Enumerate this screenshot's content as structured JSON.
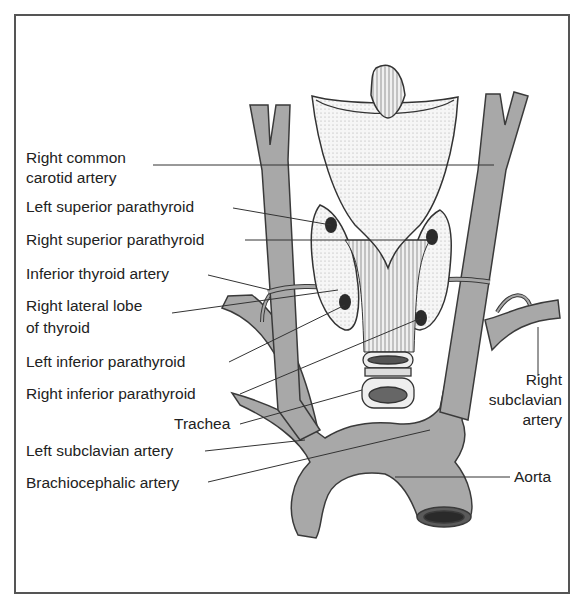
{
  "diagram": {
    "colors": {
      "vessel_fill": "#a8a8a8",
      "vessel_stroke": "#3a3a3a",
      "gland_fill": "#f4f4f4",
      "parathyroid_fill": "#2b2b2b",
      "line": "#333333",
      "frame": "#555555"
    },
    "labels": {
      "right_common_carotid_line1": "Right common",
      "right_common_carotid_line2": "carotid artery",
      "left_superior_parathyroid": "Left superior parathyroid",
      "right_superior_parathyroid": "Right superior parathyroid",
      "inferior_thyroid_artery": "Inferior thyroid artery",
      "right_lateral_lobe_line1": "Right lateral lobe",
      "right_lateral_lobe_line2": "of thyroid",
      "left_inferior_parathyroid": "Left inferior parathyroid",
      "right_inferior_parathyroid": "Right inferior parathyroid",
      "trachea": "Trachea",
      "left_subclavian_artery": "Left subclavian artery",
      "brachiocephalic_artery": "Brachiocephalic artery",
      "right_subclavian_line1": "Right",
      "right_subclavian_line2": "subclavian",
      "right_subclavian_line3": "artery",
      "aorta": "Aorta"
    }
  }
}
